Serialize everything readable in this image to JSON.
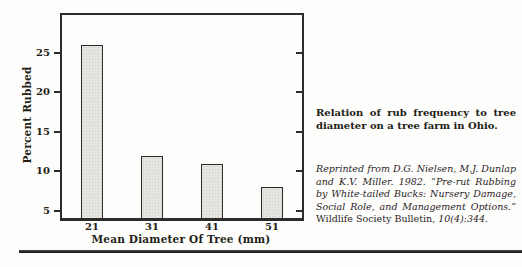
{
  "figure": {
    "caption": {
      "text": "Relation of rub frequency to tree diameter on a tree farm in Ohio."
    },
    "citation": {
      "italic_lead": "Reprinted from D.G. Nielsen, M.J. Dunlap and K.V. Miller. 1982. “Pre-rut Rubbing by White-tailed Bucks: Nursery Damage, Social Role, and Management Options.” ",
      "roman_journal": "Wildlife Society Bulletin, ",
      "italic_tail": "10(4):344."
    },
    "bottom_rule_color": "#1d1d1d"
  },
  "chart_data": {
    "type": "bar",
    "title": "",
    "categories": [
      "21",
      "31",
      "41",
      "51"
    ],
    "values": [
      26,
      12,
      11,
      8
    ],
    "xlabel": "Mean Diameter Of Tree (mm)",
    "ylabel": "Percent Rubbed",
    "ylim": [
      4.1,
      29.8
    ],
    "yticks": [
      5,
      10,
      15,
      20,
      25
    ],
    "grid": false,
    "bar_fill": "#e5e4e1",
    "bar_border": "#2b2b2b",
    "axis_color": "#2b2b2b"
  }
}
